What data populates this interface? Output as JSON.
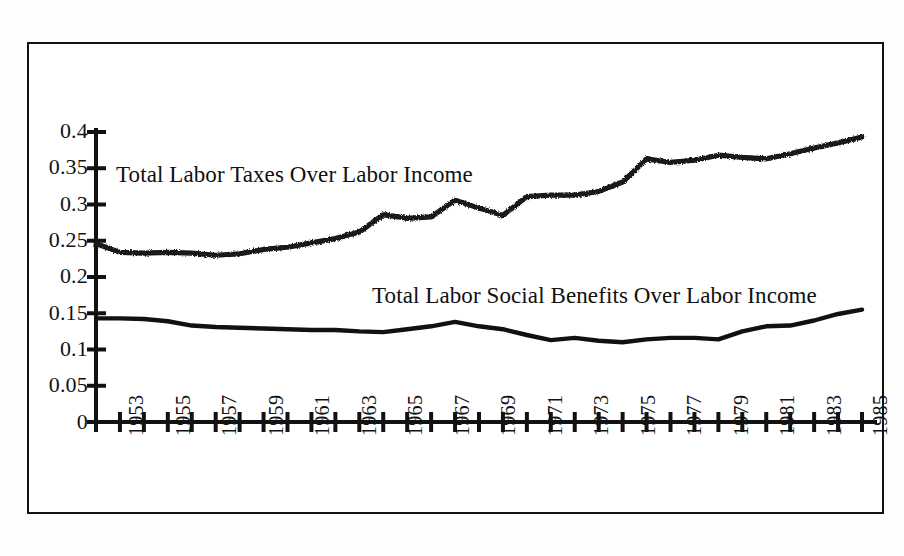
{
  "chart_data": {
    "type": "line",
    "title": "",
    "xlabel": "",
    "ylabel": "",
    "xlim": [
      1953,
      1985
    ],
    "ylim": [
      0,
      0.4
    ],
    "ytick_labels": [
      "0.4",
      "0.35",
      "0.3",
      "0.25",
      "0.2",
      "0.15",
      "0.1",
      "0.05",
      "0"
    ],
    "ytick_values": [
      0.4,
      0.35,
      0.3,
      0.25,
      0.2,
      0.15,
      0.1,
      0.05,
      0
    ],
    "xtick_labels": [
      "1953",
      "1955",
      "1957",
      "1959",
      "1961",
      "1963",
      "1965",
      "1967",
      "1969",
      "1971",
      "1973",
      "1975",
      "1977",
      "1979",
      "1981",
      "1983",
      "1985"
    ],
    "x": [
      1953,
      1954,
      1955,
      1956,
      1957,
      1958,
      1959,
      1960,
      1961,
      1962,
      1963,
      1964,
      1965,
      1966,
      1967,
      1968,
      1969,
      1970,
      1971,
      1972,
      1973,
      1974,
      1975,
      1976,
      1977,
      1978,
      1979,
      1980,
      1981,
      1982,
      1983,
      1984,
      1985
    ],
    "grid": false,
    "legend_position": "inline-annotation",
    "series": [
      {
        "name": "Total Labor Taxes Over Labor Income",
        "style": "speckled-thick",
        "color": "#151515",
        "values": [
          0.246,
          0.234,
          0.233,
          0.234,
          0.233,
          0.23,
          0.232,
          0.238,
          0.241,
          0.247,
          0.253,
          0.262,
          0.286,
          0.281,
          0.283,
          0.306,
          0.295,
          0.285,
          0.311,
          0.313,
          0.313,
          0.318,
          0.331,
          0.363,
          0.358,
          0.361,
          0.368,
          0.365,
          0.363,
          0.37,
          0.378,
          0.385,
          0.393
        ]
      },
      {
        "name": "Total Labor Social Benefits Over Labor Income",
        "style": "solid-thick",
        "color": "#111111",
        "values": [
          0.143,
          0.143,
          0.142,
          0.139,
          0.133,
          0.131,
          0.13,
          0.129,
          0.128,
          0.127,
          0.127,
          0.125,
          0.124,
          0.128,
          0.132,
          0.138,
          0.132,
          0.128,
          0.12,
          0.113,
          0.116,
          0.112,
          0.11,
          0.114,
          0.116,
          0.116,
          0.114,
          0.125,
          0.132,
          0.133,
          0.14,
          0.149,
          0.155
        ]
      }
    ],
    "annotations": [
      {
        "name": "upper-series-label",
        "text": "Total Labor Taxes Over Labor Income",
        "x_px": 116,
        "y_px": 162
      },
      {
        "name": "lower-series-label",
        "text": "Total Labor Social Benefits Over Labor Income",
        "x_px": 372,
        "y_px": 283
      }
    ]
  },
  "figure": {
    "background_color": "#ffffff",
    "frame_color": "#121212",
    "axis_color": "#121212"
  }
}
